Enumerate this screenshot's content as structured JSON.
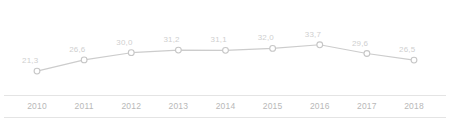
{
  "chart_data": {
    "type": "line",
    "title": "",
    "subtitle": "",
    "xlabel": "",
    "ylabel": "",
    "categories": [
      "2010",
      "2011",
      "2012",
      "2013",
      "2014",
      "2015",
      "2016",
      "2017",
      "2018"
    ],
    "values": [
      21.3,
      26.6,
      30.0,
      31.2,
      31.1,
      32.0,
      33.7,
      29.6,
      26.5
    ],
    "value_labels": [
      "21,3",
      "26,6",
      "30,0",
      "31,2",
      "31,1",
      "32,0",
      "33,7",
      "29,6",
      "26,5"
    ],
    "ylim": [
      19.0,
      35.5
    ],
    "grid": false,
    "legend": null,
    "annotations": [],
    "series": [
      {
        "name": "",
        "values": [
          21.3,
          26.6,
          30.0,
          31.2,
          31.1,
          32.0,
          33.7,
          29.6,
          26.5
        ]
      }
    ]
  },
  "style": {
    "line_color": "#cccccc",
    "marker_fill": "#ffffff",
    "marker_stroke": "#c6c6c6",
    "value_label_color": "#cfcfcf",
    "year_label_color": "#b8b8b8",
    "axis_rule_color": "#e4e4e4",
    "background": "#ffffff"
  },
  "axis": {
    "rule_top_name": "axis-rule-top",
    "rule_bottom_name": "axis-rule-bottom"
  }
}
